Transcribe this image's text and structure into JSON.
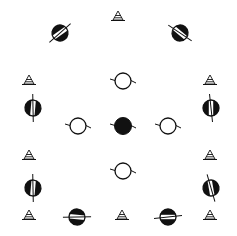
{
  "diagram": {
    "width": 237,
    "height": 236,
    "background": "#ffffff",
    "ink": "#111111",
    "cones": [
      {
        "x": 118,
        "y": 16
      },
      {
        "x": 29,
        "y": 80
      },
      {
        "x": 210,
        "y": 80
      },
      {
        "x": 29,
        "y": 155
      },
      {
        "x": 210,
        "y": 155
      },
      {
        "x": 29,
        "y": 215
      },
      {
        "x": 122,
        "y": 215
      },
      {
        "x": 210,
        "y": 215
      }
    ],
    "open_circles": [
      {
        "x": 123,
        "y": 81
      },
      {
        "x": 78,
        "y": 126
      },
      {
        "x": 168,
        "y": 126
      },
      {
        "x": 123,
        "y": 171
      }
    ],
    "solid_circles": [
      {
        "x": 123,
        "y": 126
      }
    ],
    "banded_circles": [
      {
        "x": 60,
        "y": 33,
        "angle": -35
      },
      {
        "x": 180,
        "y": 33,
        "angle": 40
      },
      {
        "x": 33,
        "y": 108,
        "angle": 95
      },
      {
        "x": 211,
        "y": 108,
        "angle": 90
      },
      {
        "x": 33,
        "y": 188,
        "angle": 95
      },
      {
        "x": 211,
        "y": 188,
        "angle": 80
      },
      {
        "x": 77,
        "y": 217,
        "angle": 5
      },
      {
        "x": 168,
        "y": 217,
        "angle": 0
      }
    ]
  }
}
